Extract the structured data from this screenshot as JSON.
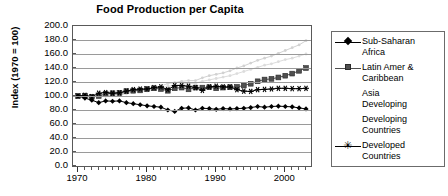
{
  "chart_data": {
    "type": "line",
    "title": "Food Production per Capita",
    "xlabel": "",
    "ylabel": "Index (1970 = 100)",
    "xlim": [
      1970,
      2003
    ],
    "ylim": [
      0,
      200
    ],
    "grid": true,
    "legend_position": "right",
    "y_ticks": [
      "0.0",
      "20.0",
      "40.0",
      "60.0",
      "80.0",
      "100.0",
      "120.0",
      "140.0",
      "160.0",
      "180.0",
      "200.0"
    ],
    "x_ticks": [
      "1970",
      "1980",
      "1990",
      "2000"
    ],
    "x": [
      1970,
      1971,
      1972,
      1973,
      1974,
      1975,
      1976,
      1977,
      1978,
      1979,
      1980,
      1981,
      1982,
      1983,
      1984,
      1985,
      1986,
      1987,
      1988,
      1989,
      1990,
      1991,
      1992,
      1993,
      1994,
      1995,
      1996,
      1997,
      1998,
      1999,
      2000,
      2001,
      2002,
      2003
    ],
    "series": [
      {
        "name": "Sub-Saharan Africa",
        "marker": "diamond",
        "color": "#000000",
        "values": [
          100.0,
          97.0,
          94.0,
          90.5,
          93.0,
          92.5,
          93.0,
          90.5,
          89.0,
          87.5,
          86.0,
          85.0,
          84.0,
          80.0,
          78.0,
          82.5,
          83.0,
          80.0,
          82.5,
          82.0,
          81.0,
          82.0,
          81.5,
          82.0,
          82.5,
          83.5,
          85.0,
          84.0,
          85.0,
          85.5,
          85.0,
          84.5,
          83.0,
          81.5
        ]
      },
      {
        "name": "Latin Amer & Caribbean",
        "marker": "square",
        "color": "#4f4f4f",
        "values": [
          100.0,
          100.5,
          99.0,
          100.0,
          103.0,
          104.0,
          104.5,
          107.0,
          107.5,
          108.0,
          110.0,
          111.0,
          110.0,
          107.5,
          111.0,
          112.0,
          109.5,
          112.0,
          112.0,
          112.5,
          111.0,
          112.0,
          112.5,
          113.0,
          115.0,
          117.5,
          121.0,
          123.5,
          124.5,
          126.5,
          129.0,
          132.0,
          136.0,
          140.0
        ]
      },
      {
        "name": "Asia Developing",
        "marker": "none",
        "color": "#d2d2d2",
        "values": [
          100.0,
          99.5,
          98.0,
          101.0,
          100.0,
          102.0,
          102.0,
          104.0,
          107.0,
          109.0,
          109.0,
          112.0,
          114.0,
          118.0,
          119.0,
          121.0,
          122.0,
          122.0,
          126.0,
          129.0,
          131.0,
          133.0,
          136.0,
          140.0,
          143.0,
          147.0,
          151.0,
          154.0,
          157.0,
          161.0,
          165.0,
          169.0,
          173.0,
          179.0
        ]
      },
      {
        "name": "Developing Countries",
        "marker": "none",
        "color": "#dcdcdc",
        "values": [
          100.0,
          99.5,
          98.0,
          100.5,
          100.0,
          101.5,
          101.5,
          103.0,
          105.5,
          107.0,
          107.0,
          109.5,
          111.0,
          114.0,
          115.0,
          117.0,
          118.0,
          118.0,
          121.0,
          123.0,
          125.0,
          127.0,
          129.0,
          132.0,
          135.0,
          138.0,
          141.0,
          144.0,
          146.0,
          149.0,
          152.0,
          154.0,
          157.0,
          160.0
        ]
      },
      {
        "name": "Developed Countries",
        "marker": "star",
        "color": "#000000",
        "values": [
          100.0,
          101.0,
          99.0,
          104.0,
          105.0,
          104.0,
          104.5,
          107.0,
          109.0,
          110.0,
          110.0,
          112.0,
          113.0,
          109.0,
          115.0,
          115.0,
          114.0,
          112.0,
          108.0,
          113.0,
          114.0,
          113.0,
          113.0,
          109.0,
          107.0,
          106.5,
          109.0,
          109.5,
          110.0,
          111.0,
          111.0,
          110.5,
          110.5,
          111.0
        ]
      }
    ],
    "legend_entries": [
      {
        "label": "Sub-Saharan\nAfrica",
        "marker": "diamond",
        "color": "#000000",
        "has_line": true
      },
      {
        "label": "Latin Amer &\nCaribbean",
        "marker": "square",
        "color": "#4f4f4f",
        "has_line": true
      },
      {
        "label": "Asia\nDeveloping",
        "marker": "none",
        "color": "#d2d2d2",
        "has_line": false
      },
      {
        "label": "Developing\nCountries",
        "marker": "none",
        "color": "#dcdcdc",
        "has_line": false
      },
      {
        "label": "Developed\nCountries",
        "marker": "star",
        "color": "#000000",
        "has_line": true
      }
    ]
  }
}
